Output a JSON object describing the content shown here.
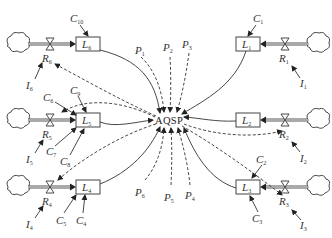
{
  "diagram": {
    "type": "stock-and-flow",
    "center_node": "AQSP",
    "stocks": [
      {
        "id": "L6",
        "label": "L",
        "sub": "6",
        "position": "top-left"
      },
      {
        "id": "L1",
        "label": "L",
        "sub": "1",
        "position": "top-right"
      },
      {
        "id": "L5",
        "label": "L",
        "sub": "5",
        "position": "middle-left"
      },
      {
        "id": "L2",
        "label": "L",
        "sub": "2",
        "position": "middle-right"
      },
      {
        "id": "L4",
        "label": "L",
        "sub": "4",
        "position": "bottom-left"
      },
      {
        "id": "L3",
        "label": "L",
        "sub": "3",
        "position": "bottom-right"
      }
    ],
    "rates": [
      {
        "id": "R6",
        "label": "R",
        "sub": "6"
      },
      {
        "id": "R1",
        "label": "R",
        "sub": "1"
      },
      {
        "id": "R5",
        "label": "R",
        "sub": "5"
      },
      {
        "id": "R2",
        "label": "R",
        "sub": "2"
      },
      {
        "id": "R4",
        "label": "R",
        "sub": "4"
      },
      {
        "id": "R3",
        "label": "R",
        "sub": "3"
      }
    ],
    "inputs": [
      {
        "id": "I6",
        "label": "I",
        "sub": "6"
      },
      {
        "id": "I1",
        "label": "I",
        "sub": "1"
      },
      {
        "id": "I5",
        "label": "I",
        "sub": "5"
      },
      {
        "id": "I2",
        "label": "I",
        "sub": "2"
      },
      {
        "id": "I4",
        "label": "I",
        "sub": "4"
      },
      {
        "id": "I3",
        "label": "I",
        "sub": "3"
      }
    ],
    "constants": [
      {
        "id": "C10",
        "label": "C",
        "sub": "10"
      },
      {
        "id": "C1",
        "label": "C",
        "sub": "1"
      },
      {
        "id": "C6",
        "label": "C",
        "sub": "6"
      },
      {
        "id": "C9",
        "label": "C",
        "sub": "9"
      },
      {
        "id": "C7",
        "label": "C",
        "sub": "7"
      },
      {
        "id": "C8",
        "label": "C",
        "sub": "8"
      },
      {
        "id": "C2",
        "label": "C",
        "sub": "2"
      },
      {
        "id": "C3",
        "label": "C",
        "sub": "3"
      },
      {
        "id": "C5",
        "label": "C",
        "sub": "5"
      },
      {
        "id": "C4",
        "label": "C",
        "sub": "4"
      }
    ],
    "parameters": [
      {
        "id": "P1",
        "label": "P",
        "sub": "1"
      },
      {
        "id": "P2",
        "label": "P",
        "sub": "2"
      },
      {
        "id": "P3",
        "label": "P",
        "sub": "3"
      },
      {
        "id": "P6",
        "label": "P",
        "sub": "6"
      },
      {
        "id": "P5",
        "label": "P",
        "sub": "5"
      },
      {
        "id": "P4",
        "label": "P",
        "sub": "4"
      }
    ]
  }
}
